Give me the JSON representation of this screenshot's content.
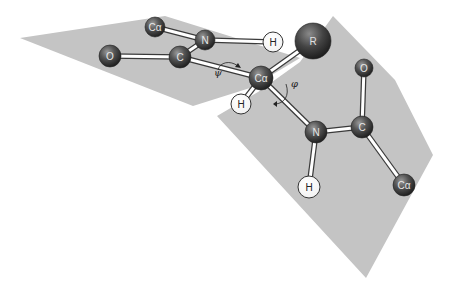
{
  "diagram": {
    "title": "",
    "type": "peptide-backbone-torsion",
    "colors": {
      "background": "#ffffff",
      "plane": "#c4c4c4",
      "atom_dark": "#4a4a4a",
      "atom_light": "#ffffff",
      "bond": "#ffffff",
      "bond_outline": "#3a3a3a"
    },
    "planes": [
      {
        "id": "left-peptide-plane",
        "points": "20,38 165,16 300,58 250,88 193,106"
      },
      {
        "id": "right-peptide-plane",
        "points": "217,116 258,92 300,62 333,16 395,80 433,155 366,278"
      }
    ],
    "atoms": [
      {
        "id": "calpha-top-left",
        "label": "Cα",
        "x": 155,
        "y": 27,
        "r": 10,
        "type": "dark"
      },
      {
        "id": "n-top",
        "label": "N",
        "x": 205,
        "y": 40,
        "r": 10,
        "type": "dark"
      },
      {
        "id": "o-left",
        "label": "O",
        "x": 110,
        "y": 56,
        "r": 11,
        "type": "dark"
      },
      {
        "id": "c-left",
        "label": "C",
        "x": 180,
        "y": 57,
        "r": 11,
        "type": "dark"
      },
      {
        "id": "h-top",
        "label": "H",
        "x": 273,
        "y": 42,
        "r": 10,
        "type": "light"
      },
      {
        "id": "r-sidechain",
        "label": "R",
        "x": 313,
        "y": 41,
        "r": 18,
        "type": "dark"
      },
      {
        "id": "calpha-center",
        "label": "Cα",
        "x": 261,
        "y": 78,
        "r": 12,
        "type": "dark"
      },
      {
        "id": "h-calpha",
        "label": "H",
        "x": 241,
        "y": 104,
        "r": 10,
        "type": "light"
      },
      {
        "id": "n-lower",
        "label": "N",
        "x": 316,
        "y": 132,
        "r": 11,
        "type": "dark"
      },
      {
        "id": "c-right",
        "label": "C",
        "x": 362,
        "y": 127,
        "r": 11,
        "type": "dark"
      },
      {
        "id": "o-right",
        "label": "O",
        "x": 364,
        "y": 68,
        "r": 9,
        "type": "dark"
      },
      {
        "id": "h-lower",
        "label": "H",
        "x": 309,
        "y": 187,
        "r": 11,
        "type": "light"
      },
      {
        "id": "calpha-right",
        "label": "Cα",
        "x": 404,
        "y": 185,
        "r": 11,
        "type": "dark"
      }
    ],
    "bonds": [
      [
        "calpha-top-left",
        "n-top"
      ],
      [
        "n-top",
        "c-left"
      ],
      [
        "o-left",
        "c-left"
      ],
      [
        "n-top",
        "h-top"
      ],
      [
        "c-left",
        "calpha-center"
      ],
      [
        "calpha-center",
        "r-sidechain"
      ],
      [
        "calpha-center",
        "h-calpha"
      ],
      [
        "calpha-center",
        "n-lower"
      ],
      [
        "n-lower",
        "c-right"
      ],
      [
        "c-right",
        "o-right"
      ],
      [
        "n-lower",
        "h-lower"
      ],
      [
        "c-right",
        "calpha-right"
      ]
    ],
    "torsion_labels": {
      "psi": {
        "symbol": "ψ",
        "x": 214,
        "y": 76
      },
      "phi": {
        "symbol": "φ",
        "x": 292,
        "y": 86
      }
    }
  }
}
